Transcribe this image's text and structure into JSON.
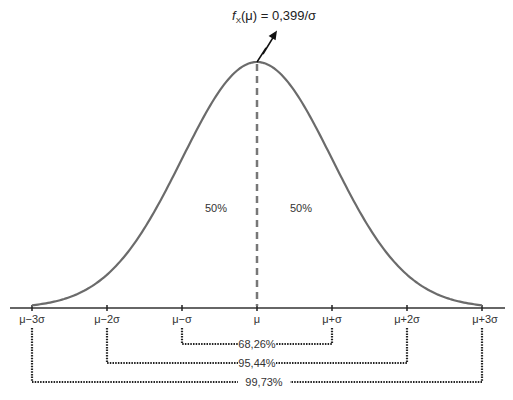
{
  "title": {
    "f": "f",
    "sub": "X",
    "rest": "(μ) = 0,399/σ"
  },
  "halves": {
    "left": "50%",
    "right": "50%"
  },
  "ticks": [
    "μ−3σ",
    "μ−2σ",
    "μ−σ",
    "μ",
    "μ+σ",
    "μ+2σ",
    "μ+3σ"
  ],
  "intervals": [
    {
      "label": "68,26%",
      "range": "μ±σ"
    },
    {
      "label": "95,44%",
      "range": "μ±2σ"
    },
    {
      "label": "99,73%",
      "range": "μ±3σ"
    }
  ],
  "colors": {
    "curve": "#6b6b6b",
    "axis": "#333333",
    "dash": "#777777",
    "bracket": "#222222"
  },
  "chart_data": {
    "type": "line",
    "annotation": "f_X(μ) = 0,399/σ",
    "x": [
      "μ−3σ",
      "μ−2σ",
      "μ−σ",
      "μ",
      "μ+σ",
      "μ+2σ",
      "μ+3σ"
    ],
    "series": [
      {
        "name": "density",
        "values": [
          0.004,
          0.054,
          0.242,
          0.399,
          0.242,
          0.054,
          0.004
        ]
      }
    ],
    "regions": [
      {
        "range": "μ−σ to μ+σ",
        "label": "68,26%"
      },
      {
        "range": "μ−2σ to μ+2σ",
        "label": "95,44%"
      },
      {
        "range": "μ−3σ to μ+3σ",
        "label": "99,73%"
      }
    ],
    "halves": [
      "50%",
      "50%"
    ]
  }
}
